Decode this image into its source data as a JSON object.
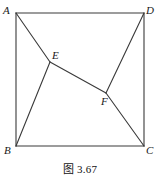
{
  "figure": {
    "caption": "图 3.67",
    "stroke_color": "#3a3a3a",
    "label_color": "#191919",
    "background_color": "#ffffff",
    "vertices": {
      "A": {
        "label": "A",
        "x": 16,
        "y": 13
      },
      "B": {
        "label": "B",
        "x": 16,
        "y": 146
      },
      "C": {
        "label": "C",
        "x": 144,
        "y": 146
      },
      "D": {
        "label": "D",
        "x": 144,
        "y": 13
      },
      "E": {
        "label": "E",
        "x": 50,
        "y": 62
      },
      "F": {
        "label": "F",
        "x": 106,
        "y": 93
      }
    },
    "segments": [
      {
        "name": "side-AD",
        "from": "A",
        "to": "D"
      },
      {
        "name": "side-DC",
        "from": "D",
        "to": "C"
      },
      {
        "name": "side-CB",
        "from": "C",
        "to": "B"
      },
      {
        "name": "side-BA",
        "from": "B",
        "to": "A"
      },
      {
        "name": "segment-AE",
        "from": "A",
        "to": "E"
      },
      {
        "name": "segment-BE",
        "from": "B",
        "to": "E"
      },
      {
        "name": "segment-EF",
        "from": "E",
        "to": "F"
      },
      {
        "name": "segment-FD",
        "from": "F",
        "to": "D"
      },
      {
        "name": "segment-FC",
        "from": "F",
        "to": "C"
      }
    ]
  }
}
